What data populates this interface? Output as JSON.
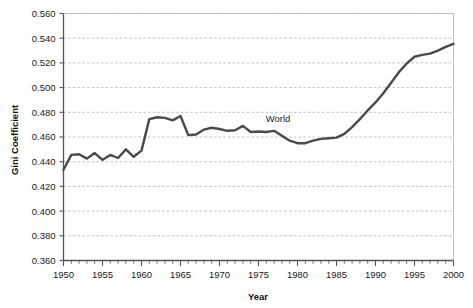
{
  "chart_data": {
    "type": "line",
    "title": "",
    "xlabel": "Year",
    "ylabel": "Gini Coefficient",
    "xlim": [
      1950,
      2000
    ],
    "ylim": [
      0.36,
      0.56
    ],
    "grid": true,
    "legend_position": "inline-annotation",
    "x_ticks": [
      1950,
      1955,
      1960,
      1965,
      1970,
      1975,
      1980,
      1985,
      1990,
      1995,
      2000
    ],
    "x_tick_labels": [
      "1950",
      "1955",
      "1960",
      "1965",
      "1970",
      "1975",
      "1980",
      "1985",
      "1990",
      "1995",
      "2000"
    ],
    "x_minor_tick_step": 1,
    "y_ticks": [
      0.36,
      0.38,
      0.4,
      0.42,
      0.44,
      0.46,
      0.48,
      0.5,
      0.52,
      0.54,
      0.56
    ],
    "y_tick_labels": [
      "0.360",
      "0.380",
      "0.400",
      "0.420",
      "0.440",
      "0.460",
      "0.480",
      "0.500",
      "0.520",
      "0.540",
      "0.560"
    ],
    "annotations": [
      {
        "text": "World",
        "x": 1977.5,
        "y": 0.4725
      }
    ],
    "series": [
      {
        "name": "World",
        "color": "#4a4a4a",
        "line_width": 2.4,
        "x": [
          1950,
          1951,
          1952,
          1953,
          1954,
          1955,
          1956,
          1957,
          1958,
          1959,
          1960,
          1961,
          1962,
          1963,
          1964,
          1965,
          1966,
          1967,
          1968,
          1969,
          1970,
          1971,
          1972,
          1973,
          1974,
          1975,
          1976,
          1977,
          1978,
          1979,
          1980,
          1981,
          1982,
          1983,
          1984,
          1985,
          1986,
          1987,
          1988,
          1989,
          1990,
          1991,
          1992,
          1993,
          1994,
          1995,
          1996,
          1997,
          1998,
          1999,
          2000
        ],
        "values": [
          0.4335,
          0.4455,
          0.446,
          0.4425,
          0.447,
          0.4415,
          0.4455,
          0.443,
          0.45,
          0.444,
          0.449,
          0.4745,
          0.476,
          0.4755,
          0.4735,
          0.477,
          0.4615,
          0.462,
          0.466,
          0.4675,
          0.4665,
          0.465,
          0.4655,
          0.469,
          0.464,
          0.4645,
          0.464,
          0.465,
          0.461,
          0.457,
          0.455,
          0.455,
          0.457,
          0.4585,
          0.459,
          0.4595,
          0.4625,
          0.468,
          0.4745,
          0.4815,
          0.488,
          0.4955,
          0.504,
          0.5125,
          0.5195,
          0.525,
          0.5265,
          0.5275,
          0.53,
          0.533,
          0.5355
        ]
      }
    ]
  },
  "axes": {
    "y_axis_title": "Gini Coefficient",
    "x_axis_title": "Year"
  },
  "colors": {
    "line": "#4a4a4a",
    "grid": "#b9b9c4",
    "frame": "#555555",
    "text": "#1a1a1a",
    "background": "#ffffff"
  }
}
